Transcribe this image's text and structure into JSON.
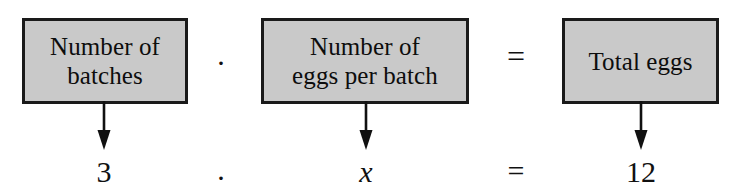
{
  "diagram": {
    "type": "word-problem-equation-model",
    "verbal_model": {
      "boxes": [
        {
          "id": "batches",
          "line1": "Number of",
          "line2": "batches"
        },
        {
          "id": "eggs-batch",
          "line1": "Number of",
          "line2": "eggs per batch"
        },
        {
          "id": "total-eggs",
          "line1": "Total eggs",
          "line2": ""
        }
      ],
      "operators": {
        "times": "·",
        "equals": "="
      }
    },
    "substituted_equation": {
      "values": [
        {
          "id": "batches",
          "text": "3",
          "italic": false
        },
        {
          "id": "eggs-batch",
          "text": "x",
          "italic": true
        },
        {
          "id": "total-eggs",
          "text": "12",
          "italic": false
        }
      ],
      "operators": {
        "times": "·",
        "equals": "="
      },
      "expression": "3 · x = 12"
    },
    "arrows": {
      "count": 3,
      "direction": "down",
      "label": "down-arrow"
    },
    "colors": {
      "box_fill": "#c9c9c9",
      "box_border": "#1a1a1a",
      "text": "#111111",
      "background": "#ffffff"
    }
  }
}
